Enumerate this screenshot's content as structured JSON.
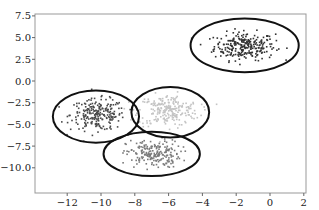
{
  "chart_data": {
    "type": "scatter",
    "title": "",
    "xlabel": "",
    "ylabel": "",
    "xlim": [
      -14,
      2
    ],
    "ylim": [
      -12,
      7.5
    ],
    "grid": false,
    "legend": null,
    "x_ticks": [
      "−12",
      "−10",
      "−8",
      "−6",
      "−4",
      "−2",
      "0",
      "2"
    ],
    "x_tick_values": [
      -12,
      -10,
      -8,
      -6,
      -4,
      -2,
      0,
      2
    ],
    "y_ticks": [
      "7.5",
      "5.0",
      "2.5",
      "0.0",
      "−2.5",
      "−5.0",
      "−7.5",
      "−10.0"
    ],
    "y_tick_values": [
      7.5,
      5.0,
      2.5,
      0.0,
      -2.5,
      -5.0,
      -7.5,
      -10.0
    ],
    "clusters": [
      {
        "name": "cluster-top-right",
        "center": [
          -1.5,
          4.0
        ],
        "spread": [
          0.9,
          0.8
        ],
        "n": 260,
        "color": "#333333",
        "ellipse": {
          "center": [
            -1.5,
            4.1
          ],
          "width": 6.4,
          "height": 6.2
        }
      },
      {
        "name": "cluster-left",
        "center": [
          -10.2,
          -3.9
        ],
        "spread": [
          0.8,
          0.9
        ],
        "n": 230,
        "color": "#4a4a4a",
        "ellipse": {
          "center": [
            -10.3,
            -4.1
          ],
          "width": 5.1,
          "height": 6.0
        }
      },
      {
        "name": "cluster-middle",
        "center": [
          -6.0,
          -3.4
        ],
        "spread": [
          0.9,
          0.9
        ],
        "n": 230,
        "color": "#c4c4c4",
        "ellipse": {
          "center": [
            -5.9,
            -3.6
          ],
          "width": 4.6,
          "height": 5.8
        }
      },
      {
        "name": "cluster-bottom",
        "center": [
          -6.9,
          -8.4
        ],
        "spread": [
          0.8,
          0.8
        ],
        "n": 200,
        "color": "#7a7a7a",
        "ellipse": {
          "center": [
            -7.0,
            -8.4
          ],
          "width": 5.7,
          "height": 5.1
        }
      }
    ]
  }
}
